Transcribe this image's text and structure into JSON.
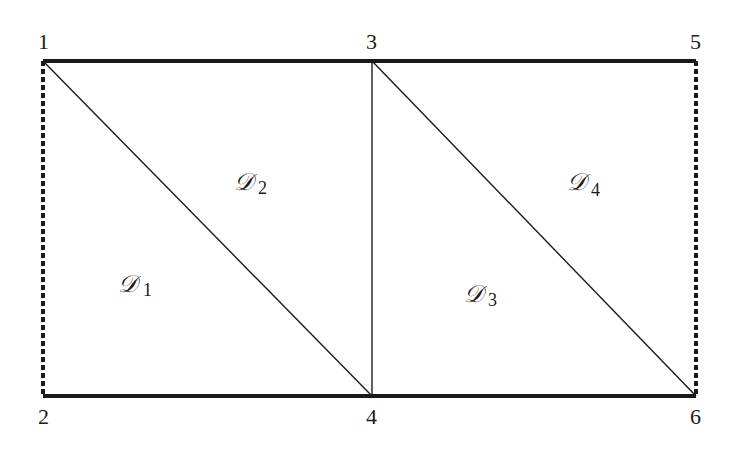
{
  "diagram": {
    "nodes": [
      {
        "id": "1",
        "label": "1",
        "x": 43,
        "y": 61
      },
      {
        "id": "2",
        "label": "2",
        "x": 43,
        "y": 396
      },
      {
        "id": "3",
        "label": "3",
        "x": 372,
        "y": 61
      },
      {
        "id": "4",
        "label": "4",
        "x": 372,
        "y": 396
      },
      {
        "id": "5",
        "label": "5",
        "x": 696,
        "y": 61
      },
      {
        "id": "6",
        "label": "6",
        "x": 696,
        "y": 396
      }
    ],
    "edges": [
      {
        "from": "1",
        "to": "3",
        "style": "thick-solid"
      },
      {
        "from": "3",
        "to": "5",
        "style": "thick-solid"
      },
      {
        "from": "2",
        "to": "4",
        "style": "thick-solid"
      },
      {
        "from": "4",
        "to": "6",
        "style": "thick-solid"
      },
      {
        "from": "1",
        "to": "2",
        "style": "thick-dashed"
      },
      {
        "from": "5",
        "to": "6",
        "style": "thick-dashed"
      },
      {
        "from": "3",
        "to": "4",
        "style": "thin-solid"
      },
      {
        "from": "1",
        "to": "4",
        "style": "thin-solid"
      },
      {
        "from": "3",
        "to": "6",
        "style": "thin-solid"
      }
    ],
    "regions": [
      {
        "id": "D1",
        "script": "𝒟",
        "subscript": "1"
      },
      {
        "id": "D2",
        "script": "𝒟",
        "subscript": "2"
      },
      {
        "id": "D3",
        "script": "𝒟",
        "subscript": "3"
      },
      {
        "id": "D4",
        "script": "𝒟",
        "subscript": "4"
      }
    ],
    "colors": {
      "line": "#1a1a1a",
      "background": "#ffffff"
    }
  }
}
